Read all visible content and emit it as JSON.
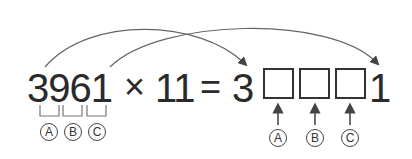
{
  "equation": {
    "multiplicand": "3961",
    "times_sign": "×",
    "multiplier": "11",
    "equals_sign": "=",
    "result_first_digit": "3",
    "result_last_digit": "1",
    "blank_boxes": 3
  },
  "labels": {
    "left": [
      "A",
      "B",
      "C"
    ],
    "right": [
      "A",
      "B",
      "C"
    ]
  },
  "colors": {
    "text": "#2a2a2a",
    "lines": "#555555"
  }
}
